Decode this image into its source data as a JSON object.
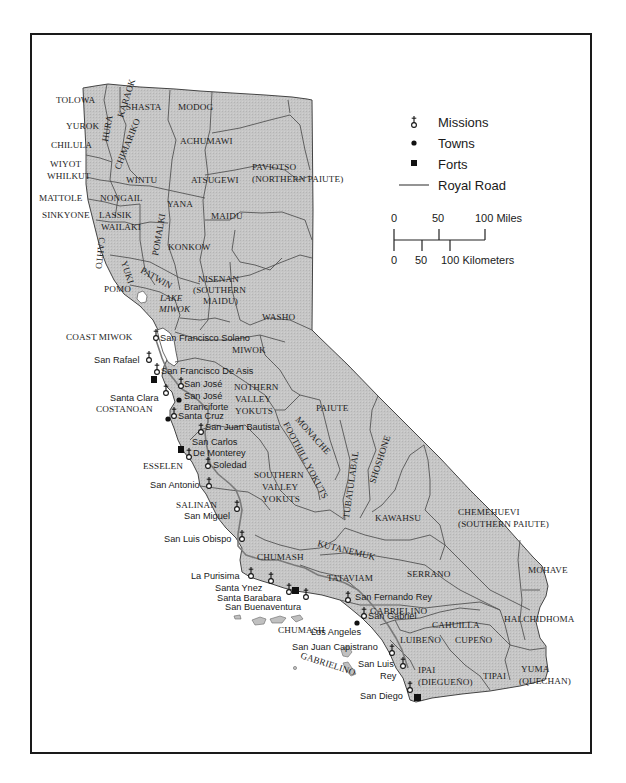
{
  "legend": {
    "missions": "Missions",
    "towns": "Towns",
    "forts": "Forts",
    "royal_road": "Royal Road"
  },
  "scale": {
    "miles": {
      "zero": "0",
      "mid": "50",
      "end": "100 Miles"
    },
    "km": {
      "zero": "0",
      "mid": "50",
      "end": "100 Kilometers"
    }
  },
  "colors": {
    "land": "#c4c4c4",
    "water": "#ffffff",
    "border": "#555555",
    "road": "#7a7a7a",
    "frame": "#1a1a1a"
  },
  "tribes": {
    "tolowa": "TOLOWA",
    "karaok": "KARAOK",
    "hura": "HURA",
    "shasta": "SHASTA",
    "modoc": "MODOG",
    "yurok": "YUROK",
    "chimariko": "CHIMARIKO",
    "achumawi": "ACHUMAWI",
    "chilula": "CHILULA",
    "wiyot": "WIYOT",
    "whilkut": "WHILKUT",
    "wintu": "WINTU",
    "atsugewi": "ATSUGEWI",
    "paviotso_1": "PAVIOTSO",
    "paviotso_2": "(NORTHERN PAIUTE)",
    "mattole": "MATTOLE",
    "nongail": "NONGAIL",
    "yana": "YANA",
    "sinkyone": "SINKYONE",
    "lassik": "LASSIK",
    "maidu": "MAIDU",
    "wailaki": "WAILAKI",
    "yuki": "YUKI",
    "pomalki": "POMALKI",
    "cahto": "CAHTO",
    "konkow": "KONKOW",
    "patwin": "PATWIN",
    "pomo": "POMO",
    "nisenan_1": "NISENAN",
    "nisenan_2": "(SOUTHERN",
    "nisenan_3": "MAIDU)",
    "lake_miwok_1": "LAKE",
    "lake_miwok_2": "MIWOK",
    "washo": "WASHO",
    "coast_miwok": "COAST MIWOK",
    "miwok": "MIWOK",
    "northern_valley_yokuts_1": "NOTHERN",
    "northern_valley_yokuts_2": "VALLEY",
    "northern_valley_yokuts_3": "YOKUTS",
    "costanoan": "COSTANOAN",
    "paiute": "PAIUTE",
    "monache": "MONACHE",
    "foothill_yokuts": "FOOTHILL YOKUTS",
    "shoshone": "SHOSHONE",
    "tubatulabal": "TUBATULABAL",
    "esselen": "ESSELEN",
    "southern_valley_yokuts_1": "SOUTHERN",
    "southern_valley_yokuts_2": "VALLEY",
    "southern_valley_yokuts_3": "YOKUTS",
    "salinan": "SALINAN",
    "kawaiisu": "KAWAHSU",
    "chemehuevi_1": "CHEMEHUEVI",
    "chemehuevi_2": "(SOUTHERN PAIUTE)",
    "kitanemuk": "KUTANEMUK",
    "chumash": "CHUMASH",
    "tataviam": "TATAVIAM",
    "serrano": "SERRANO",
    "mohave": "MOHAVE",
    "gabrielino": "GABRIELINO",
    "cahuilla": "CAHUILLA",
    "halchidhoma": "HALCHIDHOMA",
    "chumash_islands": "CHUMASH",
    "luiseno": "LUIBEÑO",
    "cupeno": "CUPEÑO",
    "gabrielino_islands": "GABRIELINO",
    "ipai_1": "IPAI",
    "ipai_2": "(DIEGUEÑO)",
    "tipai": "TIPAI",
    "yuma_1": "YUMA",
    "yuma_2": "(QUECHAN)"
  },
  "places": {
    "sf_solano": "San Francisco Solano",
    "san_rafael": "San Rafael",
    "sf_de_asis": "San Francisco De Asis",
    "san_jose_mission": "San José",
    "santa_clara": "Santa Clara",
    "san_jose_town_1": "San José",
    "san_jose_town_2": "Branciforte",
    "santa_cruz": "Santa Cruz",
    "san_juan_bautista": "San Juan Bautista",
    "san_carlos_1": "San Carlos",
    "san_carlos_2": "De Monterey",
    "soledad": "Soledad",
    "san_antonio": "San Antonio",
    "san_miguel": "San Miguel",
    "san_luis_obispo": "San Luis Obispo",
    "la_purisima": "La Purisima",
    "santa_ynez": "Santa Ynez",
    "santa_barbara": "Santa Barabara",
    "san_buenaventura": "San Buenaventura",
    "san_fernando_rey": "San Fernando Rey",
    "san_gabriel": "San Gabriel",
    "los_angeles": "Los Angeles",
    "san_juan_capistrano": "San Juan Capistrano",
    "san_luis_rey_1": "San Luis",
    "san_luis_rey_2": "Rey",
    "san_diego": "San Diego"
  }
}
